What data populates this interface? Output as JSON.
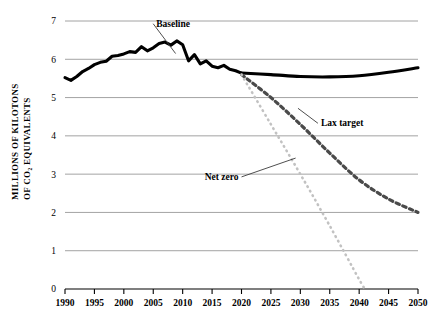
{
  "chart_data": {
    "type": "line",
    "title": "",
    "xlabel": "",
    "ylabel": "MILLIONS OF KILOTONS OF CO₂ EQUIVALENTS",
    "ylabel_line1": "MILLIONS OF KILOTONS",
    "ylabel_line2": "OF CO₂ EQUIVALENTS",
    "xlim": [
      1990,
      2050
    ],
    "ylim": [
      0,
      7
    ],
    "grid": true,
    "legend_position": "none",
    "xticks": [
      1990,
      1995,
      2000,
      2005,
      2010,
      2015,
      2020,
      2025,
      2030,
      2035,
      2040,
      2045,
      2050
    ],
    "xtick_labels": [
      "1990",
      "1995",
      "2000",
      "2005",
      "2010",
      "2015",
      "2020",
      "2025",
      "2030",
      "2035",
      "2040",
      "2045",
      "2050"
    ],
    "yticks": [
      0,
      1,
      2,
      3,
      4,
      5,
      6,
      7
    ],
    "ytick_labels": [
      "0",
      "1",
      "2",
      "3",
      "4",
      "5",
      "6",
      "7"
    ],
    "series": [
      {
        "name": "Baseline",
        "style": "solid",
        "color": "#000000",
        "x": [
          1990,
          1991,
          1992,
          1993,
          1994,
          1995,
          1996,
          1997,
          1998,
          1999,
          2000,
          2001,
          2002,
          2003,
          2004,
          2005,
          2006,
          2007,
          2008,
          2009,
          2010,
          2011,
          2012,
          2013,
          2014,
          2015,
          2016,
          2017,
          2018,
          2019,
          2020,
          2025,
          2030,
          2035,
          2040,
          2045,
          2050
        ],
        "values": [
          5.52,
          5.45,
          5.55,
          5.68,
          5.76,
          5.86,
          5.92,
          5.95,
          6.08,
          6.1,
          6.14,
          6.2,
          6.18,
          6.33,
          6.22,
          6.3,
          6.41,
          6.45,
          6.37,
          6.48,
          6.38,
          5.96,
          6.12,
          5.88,
          5.96,
          5.82,
          5.78,
          5.84,
          5.74,
          5.7,
          5.64,
          5.6,
          5.55,
          5.54,
          5.57,
          5.66,
          5.78
        ]
      },
      {
        "name": "Lax target",
        "style": "dashed",
        "color": "#4a4a4a",
        "x": [
          2020,
          2025,
          2030,
          2035,
          2040,
          2045,
          2050
        ],
        "values": [
          5.6,
          5.0,
          4.3,
          3.55,
          2.85,
          2.35,
          2.0
        ]
      },
      {
        "name": "Net zero",
        "style": "dotted",
        "color": "#c2c2c2",
        "x": [
          2020,
          2025,
          2030,
          2035,
          2040,
          2041
        ],
        "values": [
          5.6,
          4.3,
          3.0,
          1.65,
          0.25,
          0.0
        ]
      }
    ],
    "annotations": [
      {
        "text": "Baseline",
        "label_x": 2005.5,
        "label_y": 6.85
      },
      {
        "text": "Lax target",
        "label_x": 2033.5,
        "label_y": 4.25
      },
      {
        "text": "Net zero",
        "label_x": 2019.5,
        "label_y": 2.85
      }
    ]
  }
}
